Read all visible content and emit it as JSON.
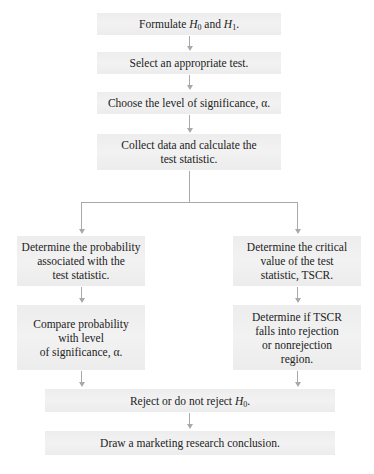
{
  "diagram": {
    "type": "flowchart",
    "title": "",
    "steps": {
      "formulate": {
        "prefix": "Formulate ",
        "h0": "H",
        "h0_sub": "0",
        "mid": " and ",
        "h1": "H",
        "h1_sub": "1",
        "suffix": "."
      },
      "select_test": {
        "label": "Select an appropriate test."
      },
      "choose_alpha": {
        "label": "Choose the level of significance, α."
      },
      "collect_data": {
        "label": "Collect data and calculate the\ntest statistic."
      },
      "left_branch": {
        "determine_probability": {
          "label": "Determine the probability\nassociated with the\ntest statistic."
        },
        "compare_probability": {
          "label": "Compare probability\nwith level\nof significance, α."
        }
      },
      "right_branch": {
        "determine_critical": {
          "label": "Determine the critical\nvalue of the test\nstatistic, TSCR."
        },
        "determine_tscr": {
          "label": "Determine if TSCR\nfalls into rejection\nor nonrejection\nregion."
        }
      },
      "reject": {
        "prefix": "Reject or do not reject ",
        "h": "H",
        "h_sub": "0",
        "suffix": "."
      },
      "conclusion": {
        "label": "Draw a marketing research conclusion."
      }
    },
    "colors": {
      "box_fill": "#efefef",
      "connector": "#a9a9a9",
      "text": "#222222"
    }
  }
}
